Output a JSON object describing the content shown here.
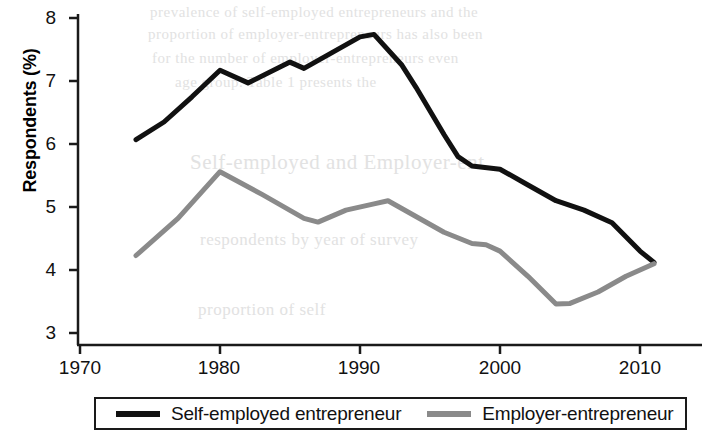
{
  "chart_data": {
    "type": "line",
    "title": "",
    "xlabel": "",
    "ylabel": "Respondents (%)",
    "xlim": [
      1968,
      2013
    ],
    "ylim": [
      3,
      8
    ],
    "xticks": [
      1970,
      1980,
      1990,
      2000,
      2010
    ],
    "yticks": [
      3,
      4,
      5,
      6,
      7,
      8
    ],
    "grid": false,
    "legend_position": "bottom",
    "series": [
      {
        "name": "Self-employed entrepreneur",
        "color": "#111111",
        "x": [
          1974,
          1976,
          1978,
          1980,
          1982,
          1985,
          1986,
          1988,
          1990,
          1991,
          1993,
          1994,
          1996,
          1997,
          1998,
          2000,
          2002,
          2004,
          2006,
          2008,
          2010,
          2011
        ],
        "y": [
          6.07,
          6.35,
          6.75,
          7.17,
          6.97,
          7.3,
          7.2,
          7.45,
          7.7,
          7.74,
          7.25,
          6.9,
          6.15,
          5.8,
          5.65,
          5.6,
          5.35,
          5.1,
          4.95,
          4.75,
          4.3,
          4.12
        ]
      },
      {
        "name": "Employer-entrepreneur",
        "color": "#8a8a8a",
        "x": [
          1974,
          1977,
          1980,
          1983,
          1986,
          1987,
          1989,
          1991,
          1992,
          1994,
          1996,
          1998,
          1999,
          2000,
          2002,
          2004,
          2005,
          2007,
          2009,
          2011
        ],
        "y": [
          4.23,
          4.82,
          5.56,
          5.2,
          4.82,
          4.76,
          4.95,
          5.05,
          5.1,
          4.85,
          4.6,
          4.42,
          4.4,
          4.3,
          3.9,
          3.46,
          3.47,
          3.65,
          3.9,
          4.1
        ]
      }
    ]
  },
  "axis": {
    "ylabel": "Respondents (%)",
    "ytick_labels": [
      "8",
      "7",
      "6",
      "5",
      "4",
      "3"
    ],
    "xtick_labels": [
      "1970",
      "1980",
      "1990",
      "2000",
      "2010"
    ]
  },
  "legend": {
    "items": [
      {
        "label": "Self-employed entrepreneur",
        "swatch": "black"
      },
      {
        "label": "Employer-entrepreneur",
        "swatch": "gray"
      }
    ]
  },
  "background_bleed": {
    "lines": [
      "prevalence of self-employed entrepreneurs and the",
      "proportion of employer-entrepreneurs has also been",
      "for the number of employer-entrepreneurs even",
      "age group. Table 1 presents the",
      "Self-employed and Employer-ent",
      "respondents by year of survey",
      "proportion of self"
    ]
  }
}
